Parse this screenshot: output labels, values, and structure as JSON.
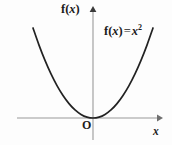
{
  "figure": {
    "background_color": "#fdfdfd",
    "axis_color": "#9a9a9a",
    "curve_color": "#222222",
    "text_color": "#1b1b1b"
  },
  "labels": {
    "y_axis": {
      "f": "f",
      "open": "(",
      "var": "x",
      "close": ")"
    },
    "x_axis": "x",
    "origin": "O",
    "equation": {
      "f": "f",
      "open": "(",
      "var": "x",
      "close": ")",
      "equals": "=",
      "base": "x",
      "exponent": "2"
    }
  },
  "chart_data": {
    "type": "line",
    "title": "",
    "subtitle": "",
    "xlabel": "x",
    "ylabel": "f(x)",
    "annotations": [
      {
        "text": "f(x) = x²",
        "x": 1.45,
        "y": 2.1,
        "role": "curve-equation"
      },
      {
        "text": "O",
        "x": 0,
        "y": 0,
        "role": "origin-marker"
      }
    ],
    "legend": [],
    "legend_position": "none",
    "grid": false,
    "xlim": [
      -1.55,
      1.75
    ],
    "ylim": [
      -0.35,
      2.55
    ],
    "axis_arrows": {
      "x": "right",
      "y": "up"
    },
    "origin_px": {
      "x": 93,
      "y": 118
    },
    "series": [
      {
        "name": "f(x) = x²",
        "equation": "y = x^2",
        "x": [
          -1.5,
          -1.35,
          -1.2,
          -1.05,
          -0.9,
          -0.75,
          -0.6,
          -0.45,
          -0.3,
          -0.15,
          0.0,
          0.15,
          0.3,
          0.45,
          0.6,
          0.75,
          0.9,
          1.05,
          1.2,
          1.35,
          1.5
        ],
        "values": [
          2.25,
          1.8225,
          1.44,
          1.1025,
          0.81,
          0.5625,
          0.36,
          0.2025,
          0.09,
          0.0225,
          0.0,
          0.0225,
          0.09,
          0.2025,
          0.36,
          0.5625,
          0.81,
          1.1025,
          1.44,
          1.8225,
          2.25
        ],
        "vertex": {
          "x": 0,
          "y": 0
        },
        "color": "#222222"
      }
    ]
  }
}
